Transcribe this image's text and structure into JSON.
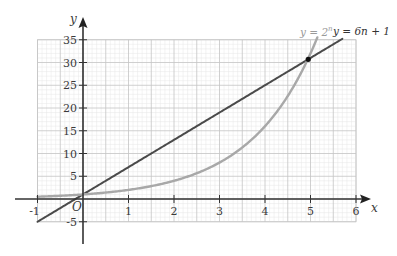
{
  "chart_data": {
    "type": "line",
    "title": "",
    "xlabel": "x",
    "ylabel": "y",
    "origin_label": "O",
    "xlim": [
      -1,
      6
    ],
    "ylim": [
      -5,
      35
    ],
    "grid": true,
    "grid_minor_x": 0.1,
    "grid_minor_y": 1,
    "grid_major_x": 0.5,
    "grid_major_y": 5,
    "x_ticks": [
      -1,
      1,
      2,
      3,
      4,
      5,
      6
    ],
    "x_tick_labels": [
      "-1",
      "1",
      "2",
      "3",
      "4",
      "5",
      "6"
    ],
    "y_ticks": [
      -5,
      5,
      10,
      15,
      20,
      25,
      30,
      35
    ],
    "y_tick_labels": [
      "-5",
      "5",
      "10",
      "15",
      "20",
      "25",
      "30",
      "35"
    ],
    "series": [
      {
        "name": "y = 6n + 1",
        "label_main": "y = 6n + 1",
        "kind": "linear",
        "slope": 6,
        "intercept": 1,
        "x_range": [
          -1,
          5.7
        ],
        "color": "#4a4a4a"
      },
      {
        "name": "y = 2^n",
        "label_base": "y = 2",
        "label_exp": "n",
        "kind": "exponential",
        "base": 2,
        "x_range": [
          -1,
          5.15
        ],
        "color": "#a8a8a8"
      }
    ],
    "annotations": [
      {
        "type": "intersection-point",
        "x": 4.95,
        "y": 30.7
      }
    ],
    "legend": "top-right"
  }
}
